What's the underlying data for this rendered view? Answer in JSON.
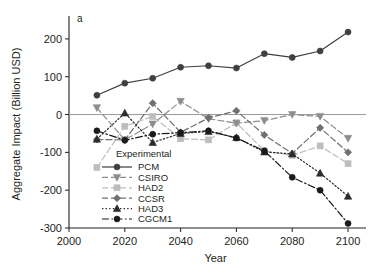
{
  "panel_label": "a",
  "chart_data": {
    "type": "line",
    "title": "",
    "xlabel": "Year",
    "ylabel": "Aggregate Impact (Billion USD)",
    "xlim": [
      2000,
      2105
    ],
    "ylim": [
      -300,
      250
    ],
    "xticks": [
      2000,
      2020,
      2040,
      2060,
      2080,
      2100
    ],
    "xtick_labels": [
      "2000",
      "2020",
      "2040",
      "2060",
      "2080",
      "2100"
    ],
    "yticks": [
      200,
      100,
      0,
      -100,
      -200,
      -300
    ],
    "ytick_labels": [
      "200",
      "100",
      "0",
      "-100",
      "-200",
      "-300"
    ],
    "grid": false,
    "zero_line": true,
    "legend_title": "Experimental",
    "legend_position": "inside-lower-left",
    "x": [
      2010,
      2020,
      2030,
      2040,
      2050,
      2060,
      2070,
      2080,
      2090,
      2100
    ],
    "series": [
      {
        "name": "PCM",
        "color": "#3f3f3f",
        "marker": "circle",
        "dash": "solid",
        "values": [
          51,
          83,
          96,
          125,
          129,
          123,
          161,
          151,
          168,
          218
        ]
      },
      {
        "name": "CSIRO",
        "color": "#8d8d8d",
        "marker": "triangle-down",
        "dash": "dashed",
        "values": [
          18,
          -67,
          -25,
          35,
          -11,
          -23,
          -16,
          0,
          -5,
          -63
        ]
      },
      {
        "name": "HAD2",
        "color": "#bdbdbd",
        "marker": "square",
        "dash": "dashed",
        "values": [
          -140,
          -31,
          -5,
          -64,
          -67,
          -22,
          -96,
          -108,
          -83,
          -130
        ]
      },
      {
        "name": "CCSR",
        "color": "#6f6f6f",
        "marker": "diamond",
        "dash": "dashed",
        "values": [
          -66,
          -67,
          30,
          -47,
          -9,
          10,
          -54,
          -103,
          -35,
          -100
        ]
      },
      {
        "name": "HAD3",
        "color": "#2b2b2b",
        "marker": "triangle-up",
        "dash": "dotted",
        "values": [
          -65,
          4,
          -74,
          -50,
          -45,
          -61,
          -99,
          -104,
          -155,
          -216
        ]
      },
      {
        "name": "CGCM1",
        "color": "#1a1a1a",
        "marker": "circle",
        "dash": "dashdot",
        "values": [
          -43,
          -68,
          -52,
          -48,
          -43,
          -62,
          -96,
          -166,
          -200,
          -288
        ]
      }
    ]
  }
}
